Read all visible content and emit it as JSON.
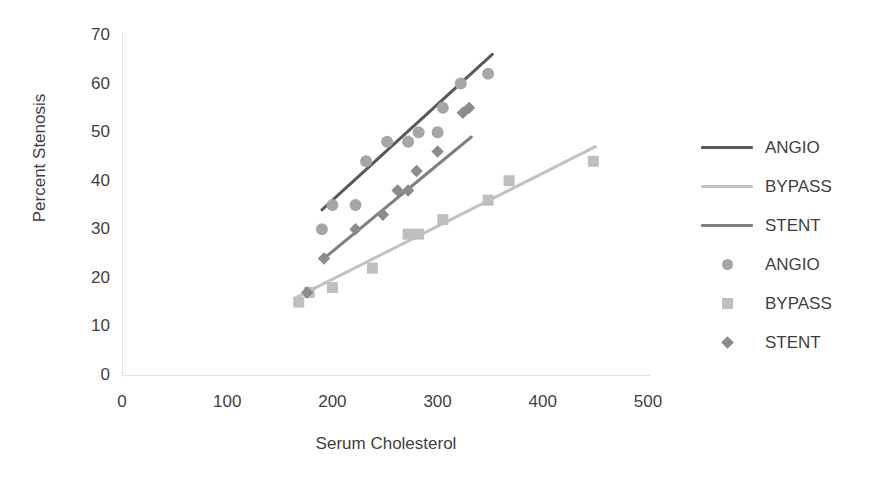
{
  "chart_data": {
    "type": "scatter",
    "title": "",
    "xlabel": "Serum Cholesterol",
    "ylabel": "Percent Stenosis",
    "xlim": [
      0,
      500
    ],
    "ylim": [
      0,
      70
    ],
    "xticks": [
      0,
      100,
      200,
      300,
      400,
      500
    ],
    "yticks": [
      0,
      10,
      20,
      30,
      40,
      50,
      60,
      70
    ],
    "grid": false,
    "legend_position": "right",
    "colors": {
      "angio": "#595959",
      "bypass": "#c2c2c2",
      "stent": "#808080"
    },
    "series": [
      {
        "name": "ANGIO",
        "marker": "circle",
        "color": "#a6a6a6",
        "points": [
          {
            "x": 190,
            "y": 30
          },
          {
            "x": 200,
            "y": 35
          },
          {
            "x": 222,
            "y": 35
          },
          {
            "x": 232,
            "y": 44
          },
          {
            "x": 252,
            "y": 48
          },
          {
            "x": 272,
            "y": 48
          },
          {
            "x": 282,
            "y": 50
          },
          {
            "x": 300,
            "y": 50
          },
          {
            "x": 305,
            "y": 55
          },
          {
            "x": 322,
            "y": 60
          },
          {
            "x": 348,
            "y": 62
          }
        ]
      },
      {
        "name": "BYPASS",
        "marker": "square",
        "color": "#bfbfbf",
        "points": [
          {
            "x": 168,
            "y": 15
          },
          {
            "x": 178,
            "y": 17
          },
          {
            "x": 200,
            "y": 18
          },
          {
            "x": 238,
            "y": 22
          },
          {
            "x": 272,
            "y": 29
          },
          {
            "x": 282,
            "y": 29
          },
          {
            "x": 305,
            "y": 32
          },
          {
            "x": 348,
            "y": 36
          },
          {
            "x": 368,
            "y": 40
          },
          {
            "x": 448,
            "y": 44
          }
        ]
      },
      {
        "name": "STENT",
        "marker": "diamond",
        "color": "#8c8c8c",
        "points": [
          {
            "x": 176,
            "y": 17
          },
          {
            "x": 192,
            "y": 24
          },
          {
            "x": 222,
            "y": 30
          },
          {
            "x": 248,
            "y": 33
          },
          {
            "x": 262,
            "y": 38
          },
          {
            "x": 272,
            "y": 38
          },
          {
            "x": 280,
            "y": 42
          },
          {
            "x": 300,
            "y": 46
          },
          {
            "x": 324,
            "y": 54
          },
          {
            "x": 330,
            "y": 55
          }
        ]
      }
    ],
    "trendlines": [
      {
        "name": "ANGIO",
        "color": "#595959",
        "x1": 190,
        "y1": 34,
        "x2": 352,
        "y2": 66
      },
      {
        "name": "BYPASS",
        "color": "#c2c2c2",
        "x1": 166,
        "y1": 16,
        "x2": 450,
        "y2": 47
      },
      {
        "name": "STENT",
        "color": "#808080",
        "x1": 192,
        "y1": 24,
        "x2": 332,
        "y2": 49
      }
    ]
  },
  "axes": {
    "y_title": "Percent Stenosis",
    "x_title": "Serum Cholesterol",
    "y_ticks": [
      "70",
      "60",
      "50",
      "40",
      "30",
      "20",
      "10",
      "0"
    ],
    "x_ticks": [
      "0",
      "100",
      "200",
      "300",
      "400",
      "500"
    ]
  },
  "legend": {
    "entries": [
      {
        "label": "ANGIO",
        "kind": "line",
        "color": "#595959"
      },
      {
        "label": "BYPASS",
        "kind": "line",
        "color": "#c2c2c2"
      },
      {
        "label": "STENT",
        "kind": "line",
        "color": "#808080"
      },
      {
        "label": "ANGIO",
        "kind": "circle",
        "color": "#a6a6a6"
      },
      {
        "label": "BYPASS",
        "kind": "square",
        "color": "#bfbfbf"
      },
      {
        "label": "STENT",
        "kind": "diamond",
        "color": "#8c8c8c"
      }
    ]
  }
}
